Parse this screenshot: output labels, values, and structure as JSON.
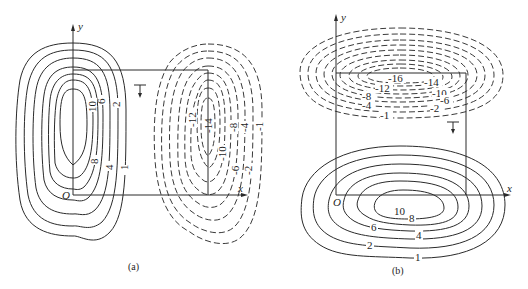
{
  "figure": {
    "panels": [
      {
        "id": "a",
        "caption": "(a)",
        "axes": {
          "x_label": "x",
          "y_label": "y",
          "origin_label": "O"
        },
        "positive_contours": {
          "style": "solid",
          "labels": [
            "10",
            "6",
            "2",
            "8",
            "4",
            "1"
          ]
        },
        "negative_contours": {
          "style": "dashed",
          "labels": [
            "-12",
            "-14",
            "-8",
            "-4",
            "-1",
            "-10",
            "-6",
            "-2"
          ]
        },
        "section_marker": "⊤"
      },
      {
        "id": "b",
        "caption": "(b)",
        "axes": {
          "x_label": "x",
          "y_label": "y",
          "origin_label": "O"
        },
        "positive_contours": {
          "style": "solid",
          "labels": [
            "10",
            "8",
            "6",
            "4",
            "2",
            "1"
          ]
        },
        "negative_contours": {
          "style": "dashed",
          "labels": [
            "-16",
            "-14",
            "-12",
            "-10",
            "-8",
            "-6",
            "-4",
            "-2",
            "-1"
          ]
        },
        "section_marker": "⊤"
      }
    ]
  }
}
